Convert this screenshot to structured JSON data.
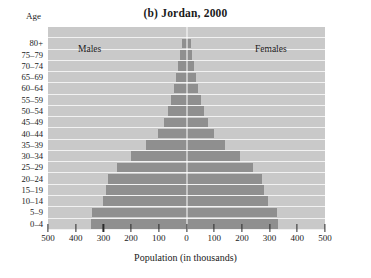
{
  "chart_data": {
    "type": "bar",
    "title": "(b) Jordan, 2000",
    "subtype": "population-pyramid",
    "xlabel": "Population (in thousands)",
    "ylabel": "Age",
    "xlim": [
      -500,
      500
    ],
    "xticks": [
      500,
      400,
      300,
      200,
      100,
      0,
      100,
      200,
      300,
      400,
      500
    ],
    "xtick_labels": [
      "500",
      "400",
      "300",
      "200",
      "100",
      "0",
      "100",
      "200",
      "300",
      "400",
      "500"
    ],
    "grid": true,
    "legend_position": "in-plot",
    "categories": [
      "80+",
      "75-79",
      "70-74",
      "65-69",
      "60-64",
      "55-59",
      "50-54",
      "45-49",
      "40-44",
      "35-39",
      "30-34",
      "25-29",
      "20-24",
      "15-19",
      "10-14",
      "5-9",
      "0-4"
    ],
    "series": [
      {
        "name": "Males",
        "side": "left",
        "values": [
          18,
          22,
          30,
          38,
          45,
          55,
          68,
          80,
          103,
          145,
          200,
          252,
          285,
          290,
          300,
          340,
          345
        ]
      },
      {
        "name": "Females",
        "side": "right",
        "values": [
          16,
          20,
          28,
          36,
          43,
          52,
          64,
          78,
          100,
          140,
          193,
          240,
          272,
          278,
          293,
          325,
          330
        ]
      }
    ],
    "colors": {
      "bar": "#8f8f8f",
      "plot_background": "#c9c9c9",
      "gridline": "#f2f2f2",
      "zero_line": "#ffffff",
      "tick": "#2a2a2a",
      "page_background": "#ffffff",
      "text": "#1a1a1a"
    }
  },
  "labels": {
    "males": "Males",
    "females": "Females"
  }
}
